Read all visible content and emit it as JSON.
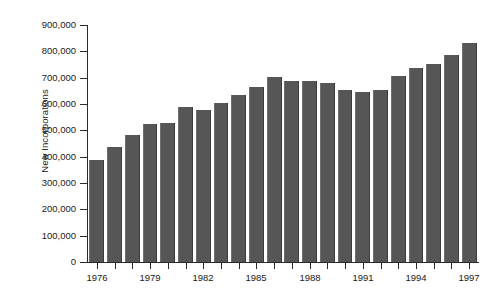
{
  "chart_data": {
    "type": "bar",
    "title": "",
    "xlabel": "",
    "ylabel": "New Incorporations",
    "ylim": [
      0,
      900000
    ],
    "grid": false,
    "legend": null,
    "bar_color": "#565656",
    "categories": [
      "1976",
      "1977",
      "1978",
      "1979",
      "1980",
      "1981",
      "1982",
      "1983",
      "1984",
      "1985",
      "1986",
      "1987",
      "1988",
      "1989",
      "1990",
      "1991",
      "1992",
      "1993",
      "1994",
      "1995",
      "1996",
      "1997"
    ],
    "values": [
      389000,
      437000,
      483000,
      525000,
      528000,
      588000,
      577000,
      602000,
      635000,
      665000,
      702000,
      686000,
      686000,
      679000,
      653000,
      646000,
      652000,
      707000,
      737000,
      752000,
      788000,
      830000
    ],
    "y_ticks": [
      0,
      100000,
      200000,
      300000,
      400000,
      500000,
      600000,
      700000,
      800000,
      900000
    ],
    "y_tick_labels": [
      "0",
      "100,000",
      "200,000",
      "300,000",
      "400,000",
      "500,000",
      "600,000",
      "700,000",
      "800,000",
      "900,000"
    ],
    "x_tick_labels": [
      "1976",
      "1979",
      "1982",
      "1985",
      "1988",
      "1991",
      "1994",
      "1997"
    ]
  }
}
